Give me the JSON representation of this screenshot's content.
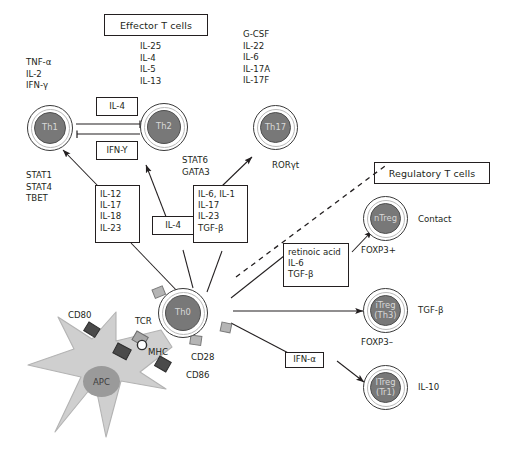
{
  "figure": {
    "sections": {
      "effector": "Effector T cells",
      "regulatory": "Regulatory T cells"
    }
  },
  "cells": {
    "th1": {
      "label": "Th1"
    },
    "th2": {
      "label": "Th2"
    },
    "th17": {
      "label": "Th17"
    },
    "th0": {
      "label": "Th0"
    },
    "apc": {
      "label": "APC"
    },
    "ntreg": {
      "label": "nTreg"
    },
    "itreg_th3": {
      "line1": "iTreg",
      "line2": "(Th3)"
    },
    "itreg_tr1": {
      "line1": "ITreg",
      "line2": "(Tr1)"
    }
  },
  "cytokines": {
    "th1_output": [
      "TNF-α",
      "IL-2",
      "IFN-γ"
    ],
    "th2_output": [
      "IL-25",
      "IL-4",
      "IL-5",
      "IL-13"
    ],
    "th17_output": [
      "G-CSF",
      "IL-22",
      "IL-6",
      "IL-17A",
      "IL-17F"
    ],
    "th1_tf": [
      "STAT1",
      "STAT4",
      "TBET"
    ],
    "th2_tf": [
      "STAT6",
      "GATA3"
    ],
    "th17_tf": [
      "RORγt"
    ]
  },
  "boxes": {
    "il4_top": [
      "IL-4"
    ],
    "ifny_mid": [
      "IFN-Y"
    ],
    "th1_drivers": [
      "IL-12",
      "IL-17",
      "IL-18",
      "IL-23"
    ],
    "th2_drivers": [
      "IL-4"
    ],
    "th17_drivers": [
      "IL-6, IL-1",
      "IL-17",
      "IL-23",
      "TGF-β"
    ],
    "treg_drivers": [
      "retinoic acid",
      "IL-6",
      "TGF-β"
    ],
    "tr1_driver": [
      "IFN-α"
    ]
  },
  "apc_markers": {
    "cd80": "CD80",
    "cd86": "CD86",
    "mhc": "MHC",
    "tcr": "TCR",
    "cd28": "CD28"
  },
  "treg_annotations": {
    "ntreg_effect": "Contact",
    "ntreg_marker": "FOXP3+",
    "th3_effect": "TGF-β",
    "th3_marker": "FOXP3–",
    "tr1_effect": "IL-10"
  },
  "colors": {
    "ink": "#231f20",
    "cell_core": "#787878",
    "cell_outline": "#3a3a3a",
    "cell_inner_ring": "#b9b9b9",
    "apc_body": "#cfcfcf",
    "apc_nucleus": "#9a9a9a",
    "nub_light": "#b5b5b5",
    "nub_dark": "#4a4a4a"
  }
}
